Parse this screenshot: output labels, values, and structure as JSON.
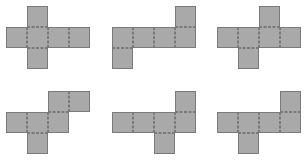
{
  "figure": {
    "cell_size": 21,
    "fill_color": "#a9a9a9",
    "edge_color": "#7a7a7a",
    "fold_color": "#8c8c8c",
    "nets": [
      {
        "id": 1,
        "origin": [
          6,
          6
        ],
        "cells": [
          [
            1,
            0
          ],
          [
            0,
            1
          ],
          [
            1,
            1
          ],
          [
            2,
            1
          ],
          [
            3,
            1
          ],
          [
            1,
            2
          ]
        ]
      },
      {
        "id": 2,
        "origin": [
          112,
          6
        ],
        "cells": [
          [
            3,
            0
          ],
          [
            0,
            1
          ],
          [
            1,
            1
          ],
          [
            2,
            1
          ],
          [
            3,
            1
          ],
          [
            0,
            2
          ]
        ]
      },
      {
        "id": 3,
        "origin": [
          217,
          6
        ],
        "cells": [
          [
            2,
            0
          ],
          [
            0,
            1
          ],
          [
            1,
            1
          ],
          [
            2,
            1
          ],
          [
            3,
            1
          ],
          [
            1,
            2
          ]
        ]
      },
      {
        "id": 4,
        "origin": [
          6,
          91
        ],
        "cells": [
          [
            2,
            0
          ],
          [
            3,
            0
          ],
          [
            0,
            1
          ],
          [
            1,
            1
          ],
          [
            2,
            1
          ],
          [
            1,
            2
          ]
        ]
      },
      {
        "id": 5,
        "origin": [
          112,
          91
        ],
        "cells": [
          [
            3,
            0
          ],
          [
            0,
            1
          ],
          [
            1,
            1
          ],
          [
            2,
            1
          ],
          [
            3,
            1
          ],
          [
            2,
            2
          ]
        ]
      },
      {
        "id": 6,
        "origin": [
          217,
          91
        ],
        "cells": [
          [
            3,
            0
          ],
          [
            0,
            1
          ],
          [
            1,
            1
          ],
          [
            2,
            1
          ],
          [
            3,
            1
          ],
          [
            1,
            2
          ]
        ]
      }
    ]
  }
}
